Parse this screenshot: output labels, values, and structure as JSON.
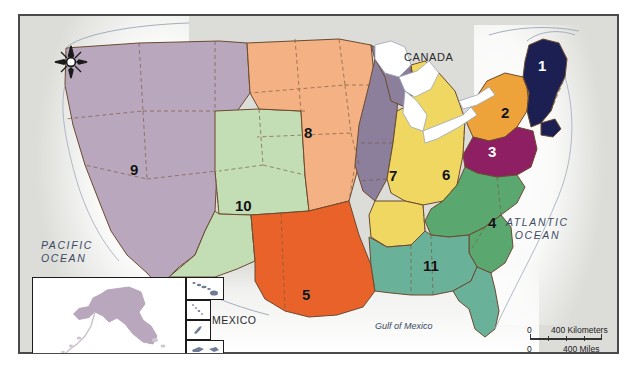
{
  "map": {
    "title": "United States Regions Reference Map",
    "frame": {
      "border_color": "#4a4a4a",
      "background_color": "#dcdcd8"
    },
    "country_labels": [
      {
        "name": "canada",
        "text": "CANADA"
      },
      {
        "name": "mexico",
        "text": "MEXICO"
      }
    ],
    "water_labels": [
      {
        "name": "pacific-ocean",
        "line1": "PACIFIC",
        "line2": "OCEAN"
      },
      {
        "name": "atlantic-ocean",
        "line1": "ATLANTIC",
        "line2": "OCEAN"
      },
      {
        "name": "gulf-of-mexico",
        "text": "Gulf of Mexico"
      }
    ],
    "regions": [
      {
        "id": 1,
        "label": "1",
        "color": "#1b1f52",
        "label_color": "#ffffff",
        "x": 519,
        "y": 42
      },
      {
        "id": 2,
        "label": "2",
        "color": "#eda23a",
        "label_color": "#111111",
        "x": 482,
        "y": 89
      },
      {
        "id": 3,
        "label": "3",
        "color": "#8e1f62",
        "label_color": "#ffffff",
        "x": 469,
        "y": 128
      },
      {
        "id": 4,
        "label": "4",
        "color": "#5aa870",
        "label_color": "#111111",
        "x": 469,
        "y": 199
      },
      {
        "id": 5,
        "label": "5",
        "color": "#e8622a",
        "label_color": "#111111",
        "x": 283,
        "y": 271
      },
      {
        "id": 6,
        "label": "6",
        "color": "#f0d761",
        "label_color": "#111111",
        "x": 423,
        "y": 151
      },
      {
        "id": 7,
        "label": "7",
        "color": "#8b7f9b",
        "label_color": "#111111",
        "x": 370,
        "y": 152
      },
      {
        "id": 8,
        "label": "8",
        "color": "#f4b183",
        "label_color": "#111111",
        "x": 285,
        "y": 109
      },
      {
        "id": 9,
        "label": "9",
        "color": "#b9a8bd",
        "label_color": "#111111",
        "x": 111,
        "y": 146
      },
      {
        "id": 10,
        "label": "10",
        "color": "#c3ddb4",
        "label_color": "#111111",
        "x": 216,
        "y": 182
      },
      {
        "id": 11,
        "label": "11",
        "color": "#6ab19a",
        "label_color": "#111111",
        "x": 404,
        "y": 242
      }
    ],
    "insets": [
      {
        "name": "alaska-inset",
        "fill": "#b9a8bd"
      },
      {
        "name": "hawaii-inset",
        "fill": "#6f7b95"
      },
      {
        "name": "island-inset-a",
        "fill": "#6f7b95"
      },
      {
        "name": "island-inset-b",
        "fill": "#6f7b95"
      },
      {
        "name": "island-inset-c",
        "fill": "#6f7b95"
      },
      {
        "name": "island-inset-d",
        "fill": "#8e6a8c"
      }
    ],
    "scale_bar": {
      "km_zero": "0",
      "km_max": "400 Kilometers",
      "mi_zero": "0",
      "mi_max": "400 Miles"
    },
    "compass": {
      "name": "north-arrow-compass-rose"
    },
    "caption": ""
  }
}
